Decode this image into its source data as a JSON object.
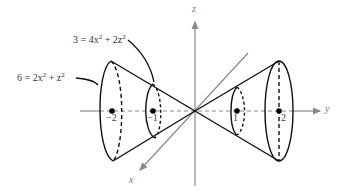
{
  "figure": {
    "type": "double cone (elliptic cone) along y-axis with level curves",
    "axes": {
      "x_label": "x",
      "y_label": "y",
      "z_label": "z"
    },
    "ticks": {
      "neg2": "−2",
      "neg1": "−1",
      "pos1": "1",
      "pos2": "2"
    },
    "equations": {
      "outer": {
        "lhs": "6 = 2x",
        "mid": " + z",
        "sup": "2"
      },
      "inner": {
        "lhs": "3 = 4x",
        "mid": " + 2z",
        "sup": "2"
      }
    },
    "colors": {
      "curve": "#111111",
      "axis": "#8a8a8a",
      "point": "#000000"
    }
  }
}
